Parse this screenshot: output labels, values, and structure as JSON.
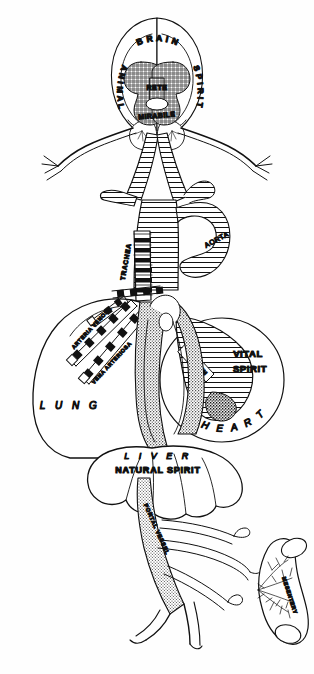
{
  "figure": {
    "kind": "anatomical-diagram",
    "background_color": "#ffffff",
    "ink_color": "#111111"
  },
  "labels": {
    "brain": "B R A I N",
    "animal_spirit_left": "A N I M A L",
    "animal_spirit_right": "S P I R I T",
    "rete_line1": "RETE",
    "rete_line2": "MIRABILE",
    "trachea": "TRACHEA",
    "aorta": "AORTA",
    "arteria_venosa": "ARTERIA VENOSA",
    "vena_arteriosa": "VENA ARTERIOSA",
    "lung": "L U N G",
    "vital_spirit_line1": "VITAL",
    "vital_spirit_line2": "SPIRIT",
    "septum": "SEPTUM",
    "heart": "H E A R T",
    "liver": "L I V E R",
    "natural_spirit": "NATURAL  SPIRIT",
    "portal_vessel": "PORTAL VESSEL",
    "mesentery": "MESENTERY"
  },
  "regions": [
    {
      "name": "brain",
      "spirit": "Animal Spirit",
      "label": "BRAIN"
    },
    {
      "name": "lung",
      "spirit": "",
      "label": "LUNG"
    },
    {
      "name": "heart",
      "spirit": "Vital Spirit",
      "label": "HEART"
    },
    {
      "name": "liver",
      "spirit": "Natural Spirit",
      "label": "LIVER"
    },
    {
      "name": "intestine",
      "spirit": "",
      "label": "MESENTERY"
    }
  ]
}
